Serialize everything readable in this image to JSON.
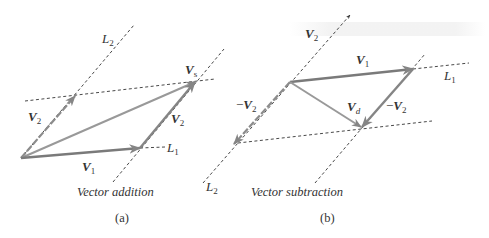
{
  "panels": [
    {
      "id": "a",
      "caption": "Vector addition",
      "panel_label": "(a)",
      "labels": {
        "L2": {
          "base": "L",
          "sub": "2"
        },
        "L1": {
          "base": "L",
          "sub": "1"
        },
        "V1": {
          "base": "V",
          "sub": "1"
        },
        "V2_left": {
          "base": "V",
          "sub": "2"
        },
        "V2_right": {
          "base": "V",
          "sub": "2"
        },
        "Vs": {
          "base": "V",
          "sub": "s"
        }
      }
    },
    {
      "id": "b",
      "caption": "Vector subtraction",
      "panel_label": "(b)",
      "labels": {
        "V2_top": {
          "base": "V",
          "sub": "2"
        },
        "V1": {
          "base": "V",
          "sub": "1"
        },
        "L1": {
          "base": "L",
          "sub": "1"
        },
        "neg_V2_left": {
          "prefix": "−",
          "base": "V",
          "sub": "2"
        },
        "neg_V2_right": {
          "prefix": "−",
          "base": "V",
          "sub": "2"
        },
        "Vd": {
          "base": "V",
          "sub": "d"
        },
        "L2": {
          "base": "L",
          "sub": "2"
        }
      }
    }
  ],
  "colors": {
    "vector": "#8c8c8c",
    "vector_dark": "#7a7a7a",
    "dashed": "#333333",
    "text": "#333333"
  }
}
